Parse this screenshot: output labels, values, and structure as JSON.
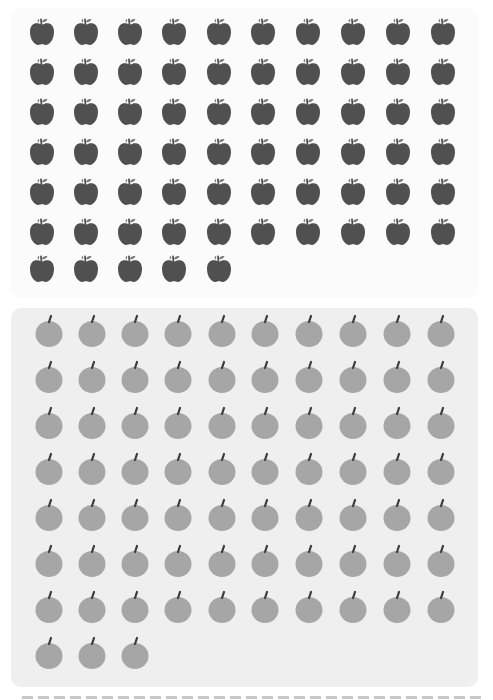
{
  "groups": [
    {
      "name": "dark-apples",
      "count": 65,
      "columns": 10,
      "icon": "apple-dark-icon",
      "color": "#505050",
      "leaf_color": "#7a7a7a",
      "panel_background": "#fbfbfb",
      "x_centers": [
        42,
        86,
        130,
        174,
        219,
        263,
        308,
        353,
        398,
        443
      ],
      "y_centers": [
        33,
        73,
        113,
        153,
        193,
        233,
        270
      ]
    },
    {
      "name": "light-apples",
      "count": 73,
      "columns": 10,
      "icon": "apple-light-icon",
      "color": "#a6a6a6",
      "stem_color": "#3c3c3c",
      "panel_background": "#efefef",
      "x_centers": [
        49,
        92,
        135,
        178,
        222,
        265,
        309,
        353,
        397,
        441
      ],
      "y_centers": [
        334,
        380,
        426,
        472,
        518,
        564,
        610,
        656
      ]
    }
  ],
  "divider": {
    "style": "dashed",
    "color": "#c8c8c8"
  }
}
